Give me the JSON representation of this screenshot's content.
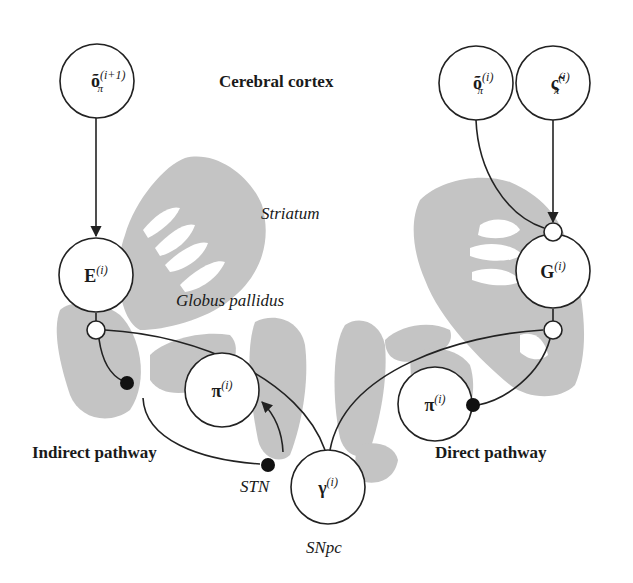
{
  "colors": {
    "anatomy_fill": "#c4c4c4",
    "line": "#222222",
    "node_fill": "#ffffff",
    "dot_fill": "#111111"
  },
  "regions": {
    "cortex": "Cerebral cortex",
    "striatum": "Striatum",
    "globus_pallidus": "Globus pallidus",
    "stn": "STN",
    "snpc": "SNpc",
    "indirect": "Indirect pathway",
    "direct": "Direct pathway"
  },
  "nodes": {
    "o_next": {
      "base": "õ",
      "sub": "π",
      "sup": "(i+1)"
    },
    "o_cur": {
      "base": "õ",
      "sub": "π",
      "sup": "(i)"
    },
    "xi_cur": {
      "base": "ς̃",
      "sub": "π",
      "sup": "(i)"
    },
    "E": {
      "base": "E",
      "sup": "(i)"
    },
    "G": {
      "base": "G",
      "sup": "(i)"
    },
    "pi_left": {
      "base": "π",
      "sup": "(i)"
    },
    "pi_right": {
      "base": "π",
      "sup": "(i)"
    },
    "gamma": {
      "base": "γ",
      "sup": "(i)"
    }
  }
}
